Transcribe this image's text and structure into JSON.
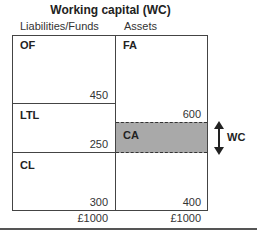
{
  "title": "Working capital (WC)",
  "headers": {
    "left": "Liabilities/Funds",
    "right": "Assets"
  },
  "left_blocks": [
    {
      "label": "OF",
      "value": "450"
    },
    {
      "label": "LTL",
      "value": "250"
    },
    {
      "label": "CL",
      "value": "300"
    }
  ],
  "right_blocks": [
    {
      "label": "FA",
      "value": "600"
    },
    {
      "label": "CA",
      "value": "400"
    }
  ],
  "wc_label": "WC",
  "totals": {
    "left": "£1000",
    "right": "£1000"
  },
  "colors": {
    "ca_fill": "#a9a9a9",
    "border": "#444444"
  }
}
